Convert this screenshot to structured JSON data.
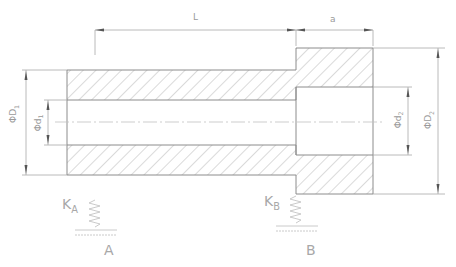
{
  "colors": {
    "outline": "#8c8c8c",
    "hatch": "#b5b5b5",
    "dimension": "#a0a0a0",
    "arrow": "#555555",
    "label": "#9a9a9a"
  },
  "dimensions": {
    "length_L": "L",
    "length_a": "a",
    "outer_diameter_left": "ΦD",
    "outer_diameter_left_sub": "1",
    "inner_diameter_left": "Φd",
    "inner_diameter_left_sub": "1",
    "inner_diameter_right": "Φd",
    "inner_diameter_right_sub": "2",
    "outer_diameter_right": "ΦD",
    "outer_diameter_right_sub": "2"
  },
  "supports": [
    {
      "stiffness_label": "K",
      "stiffness_sub": "A",
      "point_label": "A"
    },
    {
      "stiffness_label": "K",
      "stiffness_sub": "B",
      "point_label": "B"
    }
  ]
}
